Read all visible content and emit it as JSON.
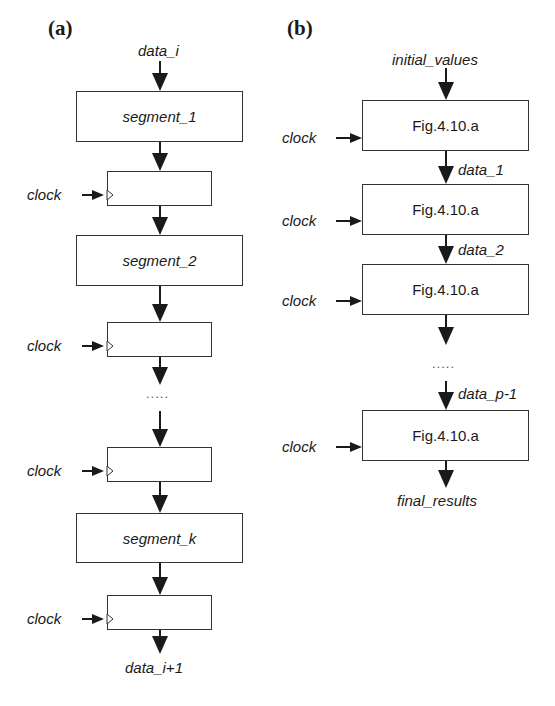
{
  "panels": {
    "a": {
      "label": "(a)",
      "input": "data_i",
      "segments": [
        "segment_1",
        "segment_2",
        "segment_k"
      ],
      "clock_label": "clock",
      "ellipsis": ".....",
      "output": "data_i+1"
    },
    "b": {
      "label": "(b)",
      "input": "initial_values",
      "block_label": "Fig.4.10.a",
      "clock_label": "clock",
      "data_labels": [
        "data_1",
        "data_2",
        "data_p-1"
      ],
      "ellipsis": ".....",
      "output": "final_results"
    }
  },
  "colors": {
    "line": "#1a1a1a",
    "box_border": "#333333",
    "background": "#ffffff"
  }
}
